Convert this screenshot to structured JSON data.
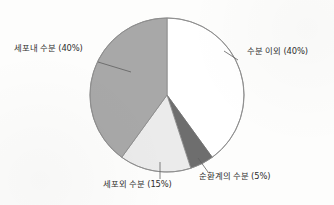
{
  "chart_data": {
    "type": "pie",
    "title": "",
    "subtitle": "",
    "xlabel": "",
    "ylabel": "",
    "legend_position": "none",
    "grid": false,
    "label_format": "{name} ({value}%)",
    "total": 100,
    "units": "%",
    "start_angle_deg": 0,
    "direction": "clockwise",
    "categories": [
      "수분 이외",
      "순환계의 수분",
      "세포외 수분",
      "세포내 수분"
    ],
    "values": [
      40,
      5,
      15,
      40
    ],
    "colors": [
      "#ffffff",
      "#6e6e6e",
      "#ebebeb",
      "#a8a8a8"
    ],
    "slices": [
      {
        "id": "nonwater",
        "name": "수분 이외",
        "value": 40,
        "label": "수분 이외 (40%)",
        "color": "#ffffff",
        "start_deg": 0,
        "end_deg": 144,
        "leader": "right"
      },
      {
        "id": "circulatory",
        "name": "순환계의 수분",
        "value": 5,
        "label": "순환계의 수분 (5%)",
        "color": "#6e6e6e",
        "start_deg": 144,
        "end_deg": 162,
        "leader": "bottom-right"
      },
      {
        "id": "extracellular",
        "name": "세포외 수분",
        "value": 15,
        "label": "세포외 수분 (15%)",
        "color": "#ebebeb",
        "start_deg": 162,
        "end_deg": 216,
        "leader": "bottom"
      },
      {
        "id": "intracellular",
        "name": "세포내 수분",
        "value": 40,
        "label": "세포내 수분 (40%)",
        "color": "#a8a8a8",
        "start_deg": 216,
        "end_deg": 360,
        "leader": "left"
      }
    ],
    "geometry": {
      "center_x": 167,
      "center_y": 95,
      "radius": 77
    },
    "style": {
      "background": "#fdfdfc",
      "outline": "#8c8c8c",
      "leader_line": "#6b6b6b",
      "text": "#2e2e2e"
    }
  }
}
